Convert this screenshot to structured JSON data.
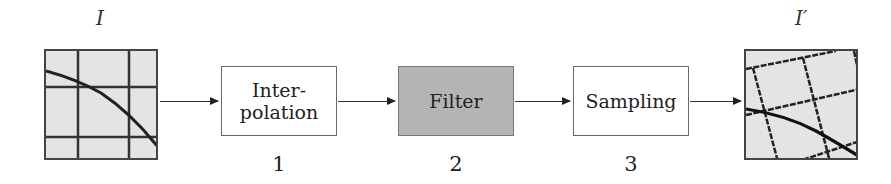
{
  "diagram": {
    "input_label": "I",
    "output_label": "I′",
    "stages": [
      {
        "label": "Inter-\npolation",
        "line1": "Inter-",
        "line2": "polation",
        "number": "1",
        "fill": "#ffffff"
      },
      {
        "label": "Filter",
        "number": "2",
        "fill": "#b4b4b4"
      },
      {
        "label": "Sampling",
        "number": "3",
        "fill": "#ffffff"
      }
    ],
    "flow": [
      "I",
      "Interpolation",
      "Filter",
      "Sampling",
      "I′"
    ]
  }
}
